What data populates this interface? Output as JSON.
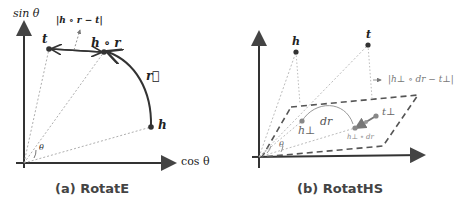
{
  "panels": [
    {
      "caption": "(a) RotatE",
      "axes": {
        "y_label": "sin θ",
        "x_label": "cos θ"
      },
      "angle_label": "θ",
      "points": {
        "t": "t",
        "h_r": "h ∘ r",
        "h": "h"
      },
      "relation_label": "r⃗",
      "distance_label": "|h ∘ r − t|"
    },
    {
      "caption": "(b) RotatHS",
      "angle_label": "θ",
      "points": {
        "h": "h",
        "t": "t",
        "h_perp": "h⊥",
        "t_perp": "t⊥",
        "h_perp_dr": "h⊥ ∘ dr"
      },
      "relation_label": "dr",
      "distance_label": "|h⊥ ∘ dr − t⊥|"
    }
  ]
}
